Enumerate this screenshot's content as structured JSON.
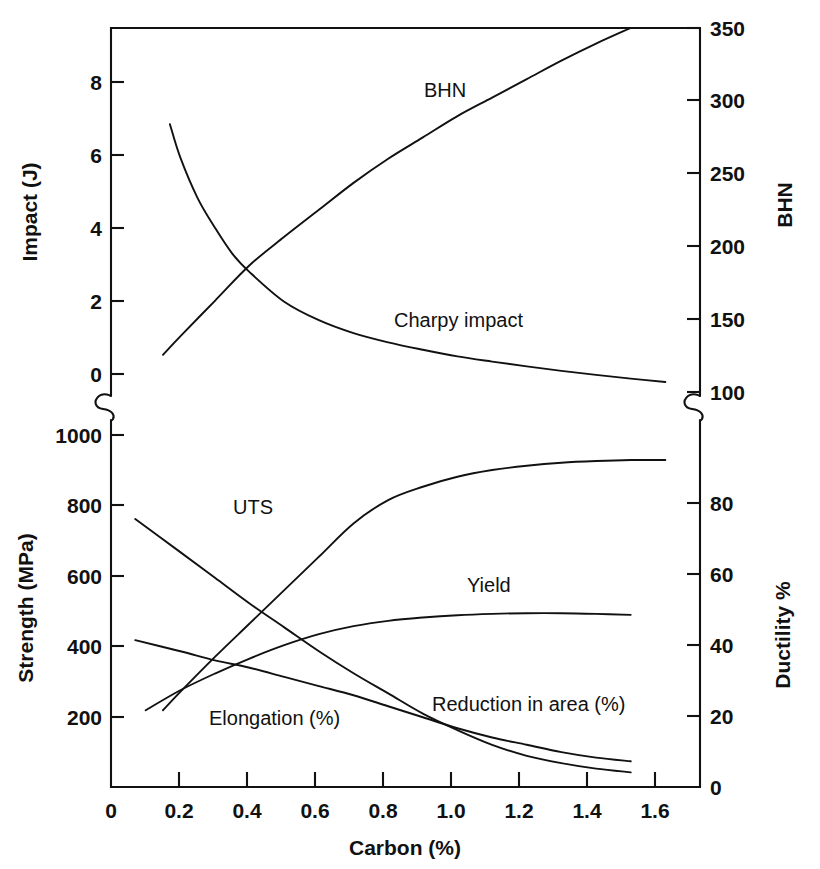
{
  "chart_data": {
    "type": "line",
    "title": "",
    "subtitle": "",
    "xlabel": "Carbon (%)",
    "xlim": [
      0,
      1.7
    ],
    "xticks": [
      0,
      0.2,
      0.4,
      0.6,
      0.8,
      1.0,
      1.2,
      1.4,
      1.6
    ],
    "xticklabels": [
      "0",
      "0.2",
      "0.4",
      "0.6",
      "0.8",
      "1.0",
      "1.2",
      "1.4",
      "1.6"
    ],
    "grid": false,
    "legend_position": "inline-annotations",
    "axis_break": true,
    "panels": [
      {
        "name": "upper",
        "left_axis": {
          "label": "Impact (J)",
          "lim": [
            -0.35,
            9.6
          ],
          "ticks": [
            0,
            2,
            4,
            6,
            8
          ],
          "ticklabels": [
            "0",
            "2",
            "4",
            "6",
            "8"
          ]
        },
        "right_axis": {
          "label": "BHN",
          "lim": [
            91,
            350
          ],
          "ticks": [
            100,
            150,
            200,
            250,
            300,
            350
          ],
          "ticklabels": [
            "100",
            "150",
            "200",
            "250",
            "300",
            "350"
          ]
        },
        "series": [
          {
            "name": "BHN",
            "label": "BHN",
            "axis": "right",
            "unit": "BHN",
            "x": [
              0.15,
              0.2,
              0.3,
              0.4,
              0.5,
              0.6,
              0.7,
              0.8,
              0.9,
              1.0,
              1.1,
              1.2,
              1.3,
              1.4,
              1.5
            ],
            "values": [
              120,
              133,
              158,
              183,
              203,
              222,
              241,
              258,
              273,
              288,
              301,
              314,
              327,
              339,
              350
            ]
          },
          {
            "name": "Charpy impact",
            "label": "Charpy impact",
            "axis": "left",
            "unit": "J",
            "x": [
              0.17,
              0.2,
              0.25,
              0.3,
              0.35,
              0.4,
              0.5,
              0.6,
              0.7,
              0.8,
              0.9,
              1.0,
              1.1,
              1.2,
              1.3,
              1.4,
              1.5,
              1.6
            ],
            "values": [
              7.0,
              6.1,
              5.0,
              4.2,
              3.5,
              3.0,
              2.2,
              1.7,
              1.35,
              1.1,
              0.9,
              0.72,
              0.58,
              0.45,
              0.33,
              0.22,
              0.12,
              0.03
            ]
          }
        ]
      },
      {
        "name": "lower",
        "left_axis": {
          "label": "Strength (MPa)",
          "lim": [
            0,
            1100
          ],
          "ticks": [
            200,
            400,
            600,
            800,
            1000
          ],
          "ticklabels": [
            "200",
            "400",
            "600",
            "800",
            "1000"
          ]
        },
        "right_axis": {
          "label": "Ductility %",
          "lim": [
            0,
            100
          ],
          "ticks": [
            0,
            20,
            40,
            60,
            80
          ],
          "ticklabels": [
            "0",
            "20",
            "40",
            "60",
            "80"
          ]
        },
        "series": [
          {
            "name": "UTS",
            "label": "UTS",
            "axis": "left",
            "unit": "MPa",
            "x": [
              0.15,
              0.2,
              0.3,
              0.4,
              0.5,
              0.6,
              0.7,
              0.8,
              0.9,
              1.0,
              1.1,
              1.2,
              1.3,
              1.4,
              1.5,
              1.6
            ],
            "values": [
              230,
              285,
              390,
              490,
              590,
              690,
              790,
              860,
              900,
              930,
              950,
              963,
              972,
              977,
              980,
              980
            ]
          },
          {
            "name": "Yield",
            "label": "Yield",
            "axis": "left",
            "unit": "MPa",
            "x": [
              0.1,
              0.2,
              0.3,
              0.4,
              0.5,
              0.6,
              0.7,
              0.8,
              0.9,
              1.0,
              1.1,
              1.2,
              1.3,
              1.4,
              1.5
            ],
            "values": [
              230,
              290,
              340,
              385,
              425,
              458,
              482,
              498,
              508,
              515,
              519,
              521,
              521,
              519,
              516
            ]
          },
          {
            "name": "Reduction in area (%)",
            "label": "Reduction in area (%)",
            "axis": "right",
            "unit": "%",
            "x": [
              0.07,
              0.2,
              0.3,
              0.4,
              0.5,
              0.6,
              0.7,
              0.8,
              0.9,
              1.0,
              1.1,
              1.2,
              1.3,
              1.4,
              1.5
            ],
            "values": [
              40,
              37,
              34.5,
              32.5,
              30,
              27.5,
              25,
              22,
              19,
              16,
              13.5,
              11.5,
              9.5,
              8,
              7
            ]
          },
          {
            "name": "Elongation (%)",
            "label": "Elongation (%)",
            "axis": "right",
            "unit": "%",
            "x": [
              0.07,
              0.2,
              0.3,
              0.4,
              0.5,
              0.6,
              0.7,
              0.8,
              0.9,
              1.0,
              1.1,
              1.2,
              1.3,
              1.4,
              1.5
            ],
            "values": [
              73,
              64,
              57,
              50,
              43.5,
              37,
              31,
              25.5,
              20,
              15.5,
              11.5,
              8.5,
              6.5,
              5,
              4
            ]
          }
        ]
      }
    ],
    "annotations": [
      {
        "text": "BHN",
        "x_px": 424,
        "y_px": 97
      },
      {
        "text": "Charpy impact",
        "x_px": 394,
        "y_px": 327
      },
      {
        "text": "UTS",
        "x_px": 233,
        "y_px": 514
      },
      {
        "text": "Yield",
        "x_px": 467,
        "y_px": 592
      },
      {
        "text": "Reduction in area (%)",
        "x_px": 432,
        "y_px": 711
      },
      {
        "text": "Elongation (%)",
        "x_px": 209,
        "y_px": 725
      }
    ]
  },
  "axes": {
    "x_title": "Carbon (%)",
    "upper_left_title": "Impact (J)",
    "upper_right_title": "BHN",
    "lower_left_title": "Strength (MPa)",
    "lower_right_title": "Ductility %"
  },
  "ticks": {
    "x": [
      "0",
      "0.2",
      "0.4",
      "0.6",
      "0.8",
      "1.0",
      "1.2",
      "1.4",
      "1.6"
    ],
    "upper_left": [
      "0",
      "2",
      "4",
      "6",
      "8"
    ],
    "upper_right": [
      "100",
      "150",
      "200",
      "250",
      "300",
      "350"
    ],
    "lower_left": [
      "200",
      "400",
      "600",
      "800",
      "1000"
    ],
    "lower_right": [
      "0",
      "20",
      "40",
      "60",
      "80"
    ]
  },
  "labels": {
    "bhn": "BHN",
    "charpy": "Charpy impact",
    "uts": "UTS",
    "yield": "Yield",
    "reduction": "Reduction in area (%)",
    "elongation": "Elongation (%)"
  },
  "colors": {
    "ink": "#111111",
    "background": "#ffffff"
  }
}
